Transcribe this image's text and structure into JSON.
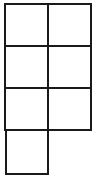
{
  "diagram": {
    "type": "grid-of-squares",
    "stroke_color": "#1a1a1a",
    "background": "#ffffff",
    "stroke_width": 2,
    "cells": [
      {
        "row": 0,
        "col": 0,
        "x": 5,
        "y": 4,
        "w": 43,
        "h": 42
      },
      {
        "row": 0,
        "col": 1,
        "x": 48,
        "y": 4,
        "w": 43,
        "h": 42
      },
      {
        "row": 1,
        "col": 0,
        "x": 5,
        "y": 46,
        "w": 43,
        "h": 42
      },
      {
        "row": 1,
        "col": 1,
        "x": 48,
        "y": 46,
        "w": 43,
        "h": 42
      },
      {
        "row": 2,
        "col": 0,
        "x": 5,
        "y": 88,
        "w": 43,
        "h": 42
      },
      {
        "row": 2,
        "col": 1,
        "x": 48,
        "y": 88,
        "w": 43,
        "h": 42
      },
      {
        "row": 3,
        "col": 0,
        "x": 6,
        "y": 130,
        "w": 42,
        "h": 44
      }
    ],
    "cell_count": 7
  }
}
